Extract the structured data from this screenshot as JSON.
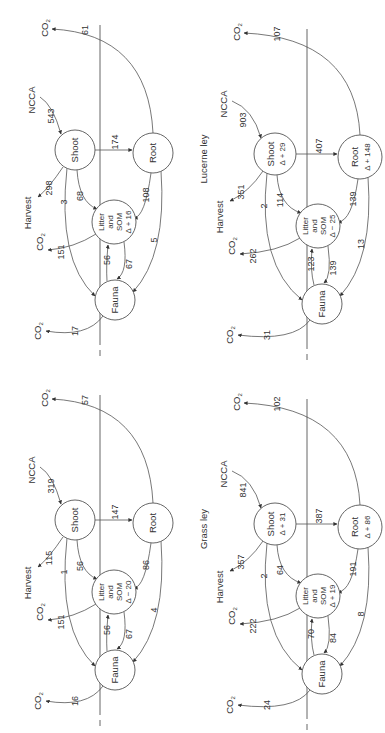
{
  "labels": {
    "co2": "CO",
    "co2_sub": "2",
    "ncca": "NCCA",
    "harvest": "Harvest",
    "shoot": "Shoot",
    "root": "Root",
    "litter_line1": "Litter",
    "litter_line2": "and",
    "litter_line3": "SOM",
    "fauna": "Fauna"
  },
  "panels": [
    {
      "id": "panel-a",
      "title": "",
      "flows": {
        "ncca_to_shoot": "543",
        "shoot_to_root": "174",
        "shoot_to_harvest": "298",
        "shoot_to_litter": "68",
        "shoot_to_fauna": "3",
        "root_to_litter": "108",
        "root_to_fauna": "5",
        "root_to_co2": "61",
        "litter_to_co2": "151",
        "litter_to_fauna": "67",
        "fauna_to_litter": "56",
        "fauna_to_co2": "17"
      },
      "deltas": {
        "shoot": "",
        "root": "",
        "litter": "Δ + 16"
      }
    },
    {
      "id": "panel-b",
      "title": "Lucerne ley",
      "flows": {
        "ncca_to_shoot": "903",
        "shoot_to_root": "407",
        "shoot_to_harvest": "351",
        "shoot_to_litter": "114",
        "shoot_to_fauna": "2",
        "root_to_litter": "139",
        "root_to_fauna": "13",
        "root_to_co2": "107",
        "litter_to_co2": "262",
        "litter_to_fauna": "139",
        "fauna_to_litter": "123",
        "fauna_to_co2": "31"
      },
      "deltas": {
        "shoot": "Δ + 29",
        "root": "Δ + 148",
        "litter": "Δ − 25"
      }
    },
    {
      "id": "panel-c",
      "title": "",
      "flows": {
        "ncca_to_shoot": "319",
        "shoot_to_root": "147",
        "shoot_to_harvest": "115",
        "shoot_to_litter": "56",
        "shoot_to_fauna": "1",
        "root_to_litter": "86",
        "root_to_fauna": "4",
        "root_to_co2": "57",
        "litter_to_co2": "151",
        "litter_to_fauna": "67",
        "fauna_to_litter": "56",
        "fauna_to_co2": "16"
      },
      "deltas": {
        "shoot": "",
        "root": "",
        "litter": "Δ − 20"
      }
    },
    {
      "id": "panel-d",
      "title": "Grass ley",
      "flows": {
        "ncca_to_shoot": "841",
        "shoot_to_root": "387",
        "shoot_to_harvest": "357",
        "shoot_to_litter": "64",
        "shoot_to_fauna": "2",
        "root_to_litter": "191",
        "root_to_fauna": "8",
        "root_to_co2": "102",
        "litter_to_co2": "222",
        "litter_to_fauna": "84",
        "fauna_to_litter": "70",
        "fauna_to_co2": "24"
      },
      "deltas": {
        "shoot": "Δ + 31",
        "root": "Δ + 86",
        "litter": "Δ + 19"
      }
    }
  ]
}
